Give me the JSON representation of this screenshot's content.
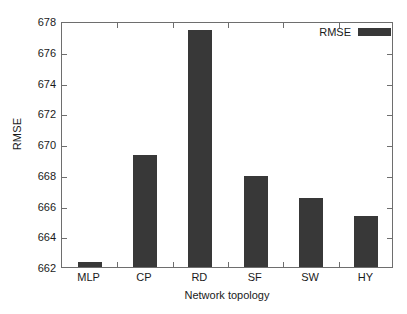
{
  "chart_data": {
    "type": "bar",
    "title": "",
    "subtitle": "",
    "xlabel": "Network topology",
    "ylabel": "RMSE",
    "categories": [
      "MLP",
      "CP",
      "RD",
      "SF",
      "SW",
      "HY"
    ],
    "values": [
      662.3,
      669.3,
      677.4,
      667.9,
      666.5,
      665.3
    ],
    "series": [
      {
        "name": "RMSE",
        "values": [
          662.3,
          669.3,
          677.4,
          667.9,
          666.5,
          665.3
        ]
      }
    ],
    "ylim": [
      662,
      678
    ],
    "ytick_labels": [
      "662",
      "664",
      "666",
      "668",
      "670",
      "672",
      "674",
      "676",
      "678"
    ],
    "ytick_values": [
      662,
      664,
      666,
      668,
      670,
      672,
      674,
      676,
      678
    ],
    "xtick_labels": [
      "MLP",
      "CP",
      "RD",
      "SF",
      "SW",
      "HY"
    ],
    "grid": false,
    "legend": {
      "position": "top-right",
      "entries": [
        {
          "label": "RMSE",
          "color": "#383838"
        }
      ]
    },
    "colors": {
      "bar": "#383838",
      "axis": "#6e6e6e",
      "text": "#1a1a1a",
      "background": "#ffffff"
    }
  }
}
